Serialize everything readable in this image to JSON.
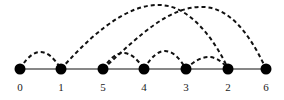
{
  "diagram": {
    "baseline_y": 69,
    "nodes": [
      {
        "label": "0",
        "x": 20
      },
      {
        "label": "1",
        "x": 61
      },
      {
        "label": "5",
        "x": 103
      },
      {
        "label": "4",
        "x": 144
      },
      {
        "label": "3",
        "x": 186
      },
      {
        "label": "2",
        "x": 228
      },
      {
        "label": "6",
        "x": 266
      }
    ],
    "arcs": [
      {
        "from": "0",
        "to": "1"
      },
      {
        "from": "1",
        "to": "2"
      },
      {
        "from": "5",
        "to": "6"
      },
      {
        "from": "5",
        "to": "4"
      },
      {
        "from": "4",
        "to": "3"
      },
      {
        "from": "3",
        "to": "2"
      }
    ]
  }
}
